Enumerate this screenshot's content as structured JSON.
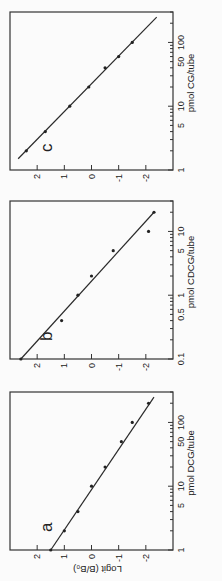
{
  "chart_data": [
    {
      "type": "line",
      "panel_label": "a",
      "title": "",
      "xlabel": "pmol DCG/tube",
      "ylabel": "Logit (B/B₀)",
      "xscale": "log",
      "xlim": [
        1,
        300
      ],
      "ylim": [
        -3,
        3
      ],
      "x_tick_labels": [
        "1",
        "5",
        "10",
        "50",
        "100"
      ],
      "y_tick_labels": [
        "2",
        "1",
        "0",
        "-1",
        "-2"
      ],
      "points": [
        {
          "x": 1.0,
          "y": 1.5
        },
        {
          "x": 2.0,
          "y": 1.0
        },
        {
          "x": 4.0,
          "y": 0.5
        },
        {
          "x": 10.0,
          "y": 0.0
        },
        {
          "x": 20.0,
          "y": -0.5
        },
        {
          "x": 50.0,
          "y": -1.1
        },
        {
          "x": 100.0,
          "y": -1.5
        },
        {
          "x": 200.0,
          "y": -2.1
        }
      ],
      "fit_line": {
        "x": [
          1.0,
          250.0
        ],
        "y": [
          1.5,
          -2.3
        ]
      }
    },
    {
      "type": "line",
      "panel_label": "b",
      "title": "",
      "xlabel": "pmol CDCG/tube",
      "ylabel": "",
      "xscale": "log",
      "xlim": [
        0.1,
        30
      ],
      "ylim": [
        -3,
        3
      ],
      "x_tick_labels": [
        "0.1",
        "0.5",
        "1",
        "5",
        "10"
      ],
      "y_tick_labels": [
        "2",
        "1",
        "0",
        "-1",
        "-2"
      ],
      "points": [
        {
          "x": 0.1,
          "y": 2.6
        },
        {
          "x": 0.4,
          "y": 1.1
        },
        {
          "x": 1.0,
          "y": 0.5
        },
        {
          "x": 2.0,
          "y": 0.0
        },
        {
          "x": 5.0,
          "y": -0.8
        },
        {
          "x": 10.0,
          "y": -2.1
        },
        {
          "x": 20.0,
          "y": -2.3
        }
      ],
      "fit_line": {
        "x": [
          0.1,
          20.0
        ],
        "y": [
          2.6,
          -2.3
        ]
      }
    },
    {
      "type": "line",
      "panel_label": "c",
      "title": "",
      "xlabel": "pmol CG/tube",
      "ylabel": "",
      "xscale": "log",
      "xlim": [
        1,
        300
      ],
      "ylim": [
        -3,
        3
      ],
      "x_tick_labels": [
        "1",
        "5",
        "10",
        "50",
        "100"
      ],
      "y_tick_labels": [
        "2",
        "1",
        "0",
        "-1",
        "-2"
      ],
      "points": [
        {
          "x": 2.0,
          "y": 2.4
        },
        {
          "x": 4.0,
          "y": 1.7
        },
        {
          "x": 10.0,
          "y": 0.8
        },
        {
          "x": 20.0,
          "y": 0.1
        },
        {
          "x": 40.0,
          "y": -0.5
        },
        {
          "x": 60.0,
          "y": -1.0
        },
        {
          "x": 100.0,
          "y": -1.5
        }
      ],
      "fit_line": {
        "x": [
          1.5,
          250.0
        ],
        "y": [
          2.7,
          -2.4
        ]
      }
    }
  ]
}
